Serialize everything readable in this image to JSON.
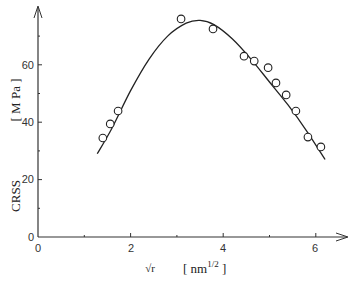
{
  "chart_data": {
    "type": "scatter",
    "title": "",
    "xlabel": "√r",
    "xunit": "[ nm^1/2 ]",
    "ylabel": "CRSS",
    "yunit": "[ M Pa ]",
    "xlim": [
      0,
      6.7
    ],
    "ylim": [
      0,
      80
    ],
    "xticks": [
      0,
      2,
      4,
      6
    ],
    "yticks": [
      0,
      20,
      40,
      60
    ],
    "grid": false,
    "legend": null,
    "series": [
      {
        "name": "measured",
        "marker": "open-circle",
        "x": [
          1.4,
          1.56,
          1.73,
          3.09,
          3.78,
          4.45,
          4.67,
          4.97,
          5.14,
          5.36,
          5.57,
          5.83,
          6.11
        ],
        "y": [
          34.5,
          39.4,
          43.9,
          76.0,
          72.5,
          63.0,
          61.3,
          59.0,
          53.7,
          49.5,
          43.9,
          34.8,
          31.4
        ]
      },
      {
        "name": "fit",
        "style": "line",
        "x": [
          1.28,
          1.6,
          2.0,
          2.4,
          2.8,
          3.2,
          3.5,
          3.8,
          4.2,
          4.6,
          5.0,
          5.4,
          5.8,
          6.2
        ],
        "y": [
          29,
          38,
          51,
          62,
          70,
          74.5,
          75.5,
          74,
          69,
          62,
          54,
          46,
          37,
          27
        ]
      }
    ]
  },
  "labels": {
    "y_title": "CRSS",
    "y_unit": "[ M Pa ]",
    "x_title": "√r",
    "x_unit_pre": "[ nm",
    "x_unit_sup": "1/2",
    "x_unit_post": " ]",
    "y_ticks": [
      "0",
      "20",
      "40",
      "60"
    ],
    "x_ticks": [
      "0",
      "2",
      "4",
      "6"
    ]
  }
}
